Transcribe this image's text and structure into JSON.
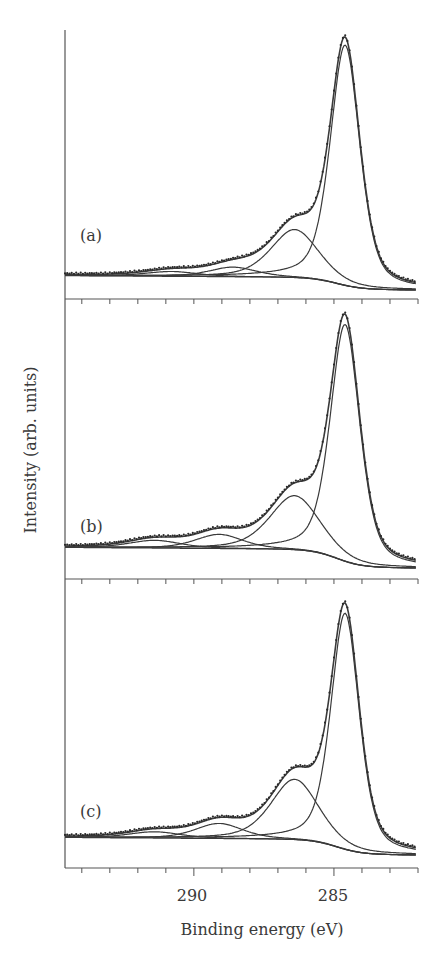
{
  "chart_data": [
    {
      "type": "line",
      "panel": "(a)",
      "title": "",
      "xlabel": "Binding energy (eV)",
      "ylabel": "Intensity (arb. units)",
      "xlim": [
        294.6,
        282
      ],
      "x_reversed": true,
      "grid": false,
      "baseline": {
        "left": 0.05,
        "right": 0.0
      },
      "components": [
        {
          "name": "C-C/C=C",
          "center": 284.6,
          "height": 1.0,
          "fwhm": 1.25
        },
        {
          "name": "C-O",
          "center": 286.4,
          "height": 0.2,
          "fwhm": 2.0
        },
        {
          "name": "C=O",
          "center": 288.6,
          "height": 0.04,
          "fwhm": 2.0
        },
        {
          "name": "O-C=O",
          "center": 290.8,
          "height": 0.02,
          "fwhm": 2.2
        }
      ],
      "series": [
        {
          "name": "measured",
          "style": "dots"
        },
        {
          "name": "envelope fit",
          "style": "line"
        },
        {
          "name": "components",
          "style": "line"
        },
        {
          "name": "background",
          "style": "line"
        }
      ]
    },
    {
      "type": "line",
      "panel": "(b)",
      "xlabel": "Binding energy (eV)",
      "ylabel": "Intensity (arb. units)",
      "xlim": [
        294.6,
        282
      ],
      "x_reversed": true,
      "grid": false,
      "baseline": {
        "left": 0.07,
        "right": 0.0
      },
      "components": [
        {
          "name": "C-C/C=C",
          "center": 284.6,
          "height": 0.92,
          "fwhm": 1.25
        },
        {
          "name": "C-O",
          "center": 286.4,
          "height": 0.21,
          "fwhm": 2.1
        },
        {
          "name": "C=O",
          "center": 289.1,
          "height": 0.055,
          "fwhm": 2.0
        },
        {
          "name": "O-C=O",
          "center": 291.4,
          "height": 0.03,
          "fwhm": 2.2
        }
      ],
      "series": [
        {
          "name": "measured",
          "style": "dots"
        },
        {
          "name": "envelope fit",
          "style": "line"
        },
        {
          "name": "components",
          "style": "line"
        },
        {
          "name": "background",
          "style": "line"
        }
      ]
    },
    {
      "type": "line",
      "panel": "(c)",
      "xlabel": "Binding energy (eV)",
      "ylabel": "Intensity (arb. units)",
      "xlim": [
        294.6,
        282
      ],
      "x_reversed": true,
      "grid": false,
      "baseline": {
        "left": 0.06,
        "right": 0.0
      },
      "components": [
        {
          "name": "C-C/C=C",
          "center": 284.6,
          "height": 0.94,
          "fwhm": 1.2
        },
        {
          "name": "C-O",
          "center": 286.4,
          "height": 0.24,
          "fwhm": 2.0
        },
        {
          "name": "C=O",
          "center": 289.1,
          "height": 0.06,
          "fwhm": 2.0
        },
        {
          "name": "O-C=O",
          "center": 291.4,
          "height": 0.025,
          "fwhm": 2.2
        }
      ],
      "series": [
        {
          "name": "measured",
          "style": "dots"
        },
        {
          "name": "envelope fit",
          "style": "line"
        },
        {
          "name": "components",
          "style": "line"
        },
        {
          "name": "background",
          "style": "line"
        }
      ]
    }
  ],
  "axes": {
    "xlabel": "Binding energy (eV)",
    "ylabel": "Intensity (arb. units)",
    "major_ticks": [
      {
        "value": 290,
        "label": "290"
      },
      {
        "value": 285,
        "label": "285"
      }
    ],
    "minor_tick_step": 1,
    "xmin": 282,
    "xmax": 294.6
  },
  "panels": [
    {
      "label": "(a)"
    },
    {
      "label": "(b)"
    },
    {
      "label": "(c)"
    }
  ],
  "colors": {
    "line": "#3a3a3a",
    "dots": "#2a2a2a",
    "axis": "#555555"
  }
}
